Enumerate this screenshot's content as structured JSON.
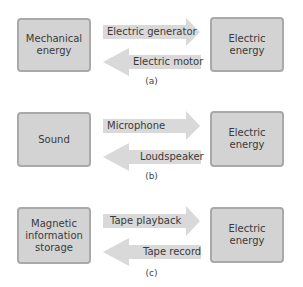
{
  "colors": {
    "box_fill": "#d3d3d3",
    "box_border": "#a9a9a9",
    "arrow_fill": "#d9d9d9",
    "text": "#3a3a3a"
  },
  "panels": [
    {
      "caption": "(a)",
      "left_box": [
        "Mechanical",
        "energy"
      ],
      "right_box": [
        "Electric",
        "energy"
      ],
      "forward_arrow": "Electric generator",
      "backward_arrow": "Electric motor"
    },
    {
      "caption": "(b)",
      "left_box": [
        "Sound"
      ],
      "right_box": [
        "Electric",
        "energy"
      ],
      "forward_arrow": "Microphone",
      "backward_arrow": "Loudspeaker"
    },
    {
      "caption": "(c)",
      "left_box": [
        "Magnetic",
        "information",
        "storage"
      ],
      "right_box": [
        "Electric",
        "energy"
      ],
      "forward_arrow": "Tape playback",
      "backward_arrow": "Tape record"
    }
  ]
}
